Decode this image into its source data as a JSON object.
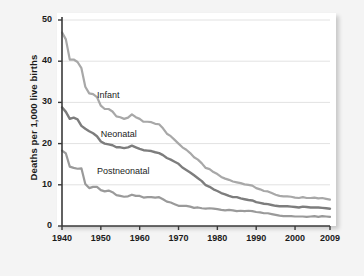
{
  "chart_data": {
    "type": "line",
    "title": "",
    "xlabel": "",
    "ylabel": "Deaths per 1,000 live births",
    "xlim": [
      1940,
      2009
    ],
    "ylim": [
      0,
      50
    ],
    "grid": "horizontal",
    "legend_position": "inline-annotation",
    "xticks": [
      "1940",
      "1950",
      "1960",
      "1970",
      "1980",
      "1990",
      "2000",
      "2009"
    ],
    "xtick_values": [
      1940,
      1950,
      1960,
      1970,
      1980,
      1990,
      2000,
      2009
    ],
    "yticks": [
      "0",
      "10",
      "20",
      "30",
      "40",
      "50"
    ],
    "ytick_values": [
      0,
      10,
      20,
      30,
      40,
      50
    ],
    "x": [
      1940,
      1941,
      1942,
      1943,
      1944,
      1945,
      1946,
      1947,
      1948,
      1949,
      1950,
      1951,
      1952,
      1953,
      1954,
      1955,
      1956,
      1957,
      1958,
      1959,
      1960,
      1961,
      1962,
      1963,
      1964,
      1965,
      1966,
      1967,
      1968,
      1969,
      1970,
      1971,
      1972,
      1973,
      1974,
      1975,
      1976,
      1977,
      1978,
      1979,
      1980,
      1981,
      1982,
      1983,
      1984,
      1985,
      1986,
      1987,
      1988,
      1989,
      1990,
      1991,
      1992,
      1993,
      1994,
      1995,
      1996,
      1997,
      1998,
      1999,
      2000,
      2001,
      2002,
      2003,
      2004,
      2005,
      2006,
      2007,
      2008,
      2009
    ],
    "series": [
      {
        "name": "Infant",
        "color": "#a8a8a8",
        "label_x": 1949,
        "label_y": 31.5,
        "values": [
          47.0,
          45.3,
          40.4,
          40.4,
          39.8,
          38.3,
          33.8,
          32.2,
          32.0,
          31.3,
          29.2,
          28.4,
          28.4,
          27.8,
          26.6,
          26.4,
          26.0,
          26.3,
          27.1,
          26.4,
          26.0,
          25.3,
          25.3,
          25.2,
          24.8,
          24.7,
          23.7,
          22.4,
          21.8,
          20.9,
          20.0,
          19.1,
          18.5,
          17.7,
          16.7,
          16.1,
          15.2,
          14.1,
          13.8,
          13.1,
          12.6,
          11.9,
          11.5,
          11.2,
          10.8,
          10.6,
          10.4,
          10.1,
          10.0,
          9.8,
          9.2,
          8.9,
          8.5,
          8.4,
          8.0,
          7.6,
          7.3,
          7.2,
          7.2,
          7.1,
          6.9,
          6.8,
          7.0,
          6.8,
          6.8,
          6.9,
          6.7,
          6.8,
          6.6,
          6.4
        ]
      },
      {
        "name": "Neonatal",
        "color": "#7d7d7d",
        "label_x": 1950,
        "label_y": 22.0,
        "values": [
          28.8,
          27.7,
          26.0,
          26.3,
          25.9,
          24.3,
          23.6,
          23.0,
          22.5,
          21.8,
          20.5,
          20.0,
          19.8,
          19.6,
          19.1,
          19.1,
          18.9,
          19.1,
          19.5,
          19.1,
          18.7,
          18.4,
          18.3,
          18.2,
          17.9,
          17.7,
          17.2,
          16.5,
          16.1,
          15.6,
          15.1,
          14.2,
          13.6,
          13.0,
          12.3,
          11.6,
          10.9,
          9.9,
          9.5,
          8.9,
          8.5,
          8.0,
          7.7,
          7.3,
          7.0,
          7.0,
          6.7,
          6.5,
          6.3,
          6.2,
          5.8,
          5.6,
          5.4,
          5.3,
          5.1,
          4.9,
          4.8,
          4.8,
          4.8,
          4.7,
          4.6,
          4.5,
          4.7,
          4.6,
          4.5,
          4.5,
          4.5,
          4.4,
          4.3,
          4.2
        ]
      },
      {
        "name": "Postneonatal",
        "color": "#9a9a9a",
        "label_x": 1949,
        "label_y": 13.0,
        "values": [
          18.3,
          17.6,
          14.4,
          14.1,
          13.9,
          14.0,
          10.2,
          9.2,
          9.5,
          9.5,
          8.7,
          8.4,
          8.6,
          8.2,
          7.5,
          7.3,
          7.1,
          7.2,
          7.6,
          7.3,
          7.3,
          6.9,
          7.0,
          7.0,
          6.9,
          7.0,
          6.5,
          5.9,
          5.7,
          5.3,
          4.9,
          4.9,
          4.9,
          4.7,
          4.4,
          4.5,
          4.3,
          4.2,
          4.3,
          4.2,
          4.1,
          3.9,
          3.8,
          3.9,
          3.8,
          3.6,
          3.7,
          3.6,
          3.7,
          3.6,
          3.4,
          3.3,
          3.1,
          3.1,
          2.9,
          2.7,
          2.5,
          2.4,
          2.4,
          2.4,
          2.3,
          2.3,
          2.3,
          2.2,
          2.3,
          2.4,
          2.2,
          2.4,
          2.3,
          2.2
        ]
      }
    ],
    "annotations": [
      {
        "text": "Infant"
      },
      {
        "text": "Neonatal"
      },
      {
        "text": "Postneonatal"
      }
    ]
  },
  "axis": {
    "y_title": "Deaths per 1,000 live births"
  },
  "colors": {
    "background": "#f4f4f4",
    "panel": "#ffffff",
    "grid": "#e2e2e2",
    "axis": "#3a3a3a",
    "text": "#1b1b1b"
  }
}
